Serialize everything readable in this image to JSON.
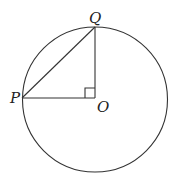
{
  "diagram": {
    "type": "geometry",
    "circle": {
      "cx": 95,
      "cy": 99,
      "r": 72.5
    },
    "points": {
      "P": {
        "label": "P",
        "x": 22,
        "y": 98
      },
      "Q": {
        "label": "Q",
        "x": 95,
        "y": 27
      },
      "O": {
        "label": "O",
        "x": 95,
        "y": 98
      }
    },
    "segments": [
      {
        "from": "P",
        "to": "Q"
      },
      {
        "from": "P",
        "to": "O"
      },
      {
        "from": "Q",
        "to": "O"
      }
    ],
    "right_angle_marker": {
      "at": "O",
      "size": 10
    }
  }
}
